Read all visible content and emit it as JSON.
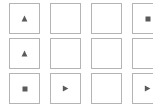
{
  "panel": {
    "title": "Icon Grid Palette",
    "background_color": "#ffffff",
    "cell_border_color": "#b4b4b4",
    "icon_color": "#5a5a5a",
    "columns": 4,
    "rows": 3
  },
  "grid": {
    "rows": [
      {
        "index": 0,
        "cells": [
          {
            "index": 0,
            "icon": "triangle-up-icon",
            "label": "Up",
            "empty": false
          },
          {
            "index": 1,
            "icon": "none",
            "label": "",
            "empty": true
          },
          {
            "index": 2,
            "icon": "none",
            "label": "",
            "empty": true
          },
          {
            "index": 3,
            "icon": "square-stop-icon",
            "label": "Stop",
            "empty": false
          }
        ]
      },
      {
        "index": 1,
        "cells": [
          {
            "index": 0,
            "icon": "triangle-up-icon",
            "label": "Up",
            "empty": false
          },
          {
            "index": 1,
            "icon": "none",
            "label": "",
            "empty": true
          },
          {
            "index": 2,
            "icon": "none",
            "label": "",
            "empty": true
          },
          {
            "index": 3,
            "icon": "none",
            "label": "",
            "empty": true
          }
        ]
      },
      {
        "index": 2,
        "cells": [
          {
            "index": 0,
            "icon": "square-stop-icon",
            "label": "Stop",
            "empty": false
          },
          {
            "index": 1,
            "icon": "triangle-right-icon",
            "label": "Play",
            "empty": false
          },
          {
            "index": 2,
            "icon": "none",
            "label": "",
            "empty": true
          },
          {
            "index": 3,
            "icon": "triangle-right-icon",
            "label": "Play",
            "empty": false
          }
        ]
      }
    ]
  }
}
